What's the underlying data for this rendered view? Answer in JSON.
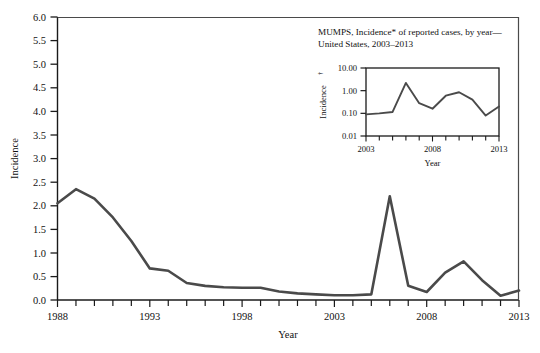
{
  "figure": {
    "kind": "statistical-line-figure",
    "background_color": "#ffffff",
    "line_color": "#4a4a4a",
    "axis_color": "#1a1a1a"
  },
  "chart_data": [
    {
      "id": "main",
      "type": "line",
      "title": "",
      "xlabel": "Year",
      "ylabel": "Incidence",
      "xlim": [
        1988,
        2013
      ],
      "ylim": [
        0.0,
        6.0
      ],
      "yscale": "linear",
      "grid": false,
      "legend": false,
      "x_tick_labels": [
        "1988",
        "1993",
        "1998",
        "2003",
        "2008",
        "2013"
      ],
      "x_tick_label_values": [
        1988,
        1993,
        1998,
        2003,
        2008,
        2013
      ],
      "x_minor_tick_interval": 1,
      "y_tick_labels": [
        "0.0",
        "0.5",
        "1.0",
        "1.5",
        "2.0",
        "2.5",
        "3.0",
        "3.5",
        "4.0",
        "4.5",
        "5.0",
        "5.5",
        "6.0"
      ],
      "y_tick_values": [
        0.0,
        0.5,
        1.0,
        1.5,
        2.0,
        2.5,
        3.0,
        3.5,
        4.0,
        4.5,
        5.0,
        5.5,
        6.0
      ],
      "x": [
        1988,
        1989,
        1990,
        1991,
        1992,
        1993,
        1994,
        1995,
        1996,
        1997,
        1998,
        1999,
        2000,
        2001,
        2002,
        2003,
        2004,
        2005,
        2006,
        2007,
        2008,
        2009,
        2010,
        2011,
        2012,
        2013
      ],
      "values": [
        2.05,
        2.35,
        2.15,
        1.75,
        1.25,
        0.67,
        0.62,
        0.36,
        0.3,
        0.27,
        0.26,
        0.26,
        0.18,
        0.14,
        0.12,
        0.1,
        0.1,
        0.12,
        2.2,
        0.3,
        0.17,
        0.58,
        0.82,
        0.42,
        0.09,
        0.2
      ]
    },
    {
      "id": "inset",
      "type": "line",
      "title": "MUMPS, Incidence* of reported cases, by year—United States, 2003–2013",
      "title_line_1": "MUMPS, Incidence* of reported cases, by year—",
      "title_line_2": "United States, 2003–2013",
      "xlabel": "Year",
      "ylabel": "Incidence",
      "ylabel_superscript": "†",
      "xlim": [
        2003,
        2013
      ],
      "ylim": [
        0.01,
        10.0
      ],
      "yscale": "log",
      "grid": false,
      "legend": false,
      "x_tick_labels": [
        "2003",
        "2008",
        "2013"
      ],
      "x_tick_label_values": [
        2003,
        2008,
        2013
      ],
      "x_minor_tick_interval": 1,
      "y_tick_labels": [
        "0.01",
        "0.10",
        "1.00",
        "10.00"
      ],
      "y_tick_values": [
        0.01,
        0.1,
        1.0,
        10.0
      ],
      "x": [
        2003,
        2004,
        2005,
        2006,
        2007,
        2008,
        2009,
        2010,
        2011,
        2012,
        2013
      ],
      "values": [
        0.09,
        0.1,
        0.115,
        2.2,
        0.28,
        0.16,
        0.6,
        0.85,
        0.4,
        0.08,
        0.2
      ]
    }
  ],
  "main_chart": {
    "y_axis_title": "Incidence",
    "x_axis_title": "Year",
    "y_labels": [
      "6.0",
      "5.5",
      "5.0",
      "4.5",
      "4.0",
      "3.5",
      "3.0",
      "2.5",
      "2.0",
      "1.5",
      "1.0",
      "0.5",
      "0.0"
    ],
    "x_labels": [
      "1988",
      "1993",
      "1998",
      "2003",
      "2008",
      "2013"
    ]
  },
  "inset_chart": {
    "title_line_1": "MUMPS, Incidence* of reported cases, by year—",
    "title_line_2": "United States, 2003–2013",
    "y_axis_title": "Incidence",
    "y_axis_title_superscript": "†",
    "x_axis_title": "Year",
    "y_labels": [
      "10.00",
      "1.00",
      "0.10",
      "0.01"
    ],
    "x_labels": [
      "2003",
      "2008",
      "2013"
    ]
  }
}
